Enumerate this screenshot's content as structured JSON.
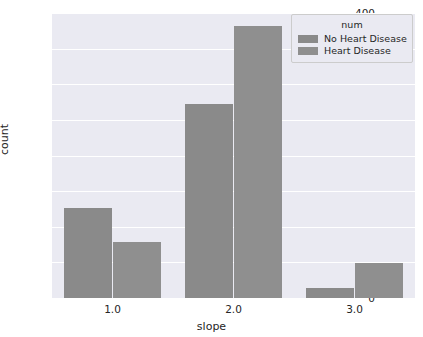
{
  "chart_data": {
    "type": "bar",
    "title": "",
    "xlabel": "slope",
    "ylabel": "count",
    "categories": [
      "1.0",
      "2.0",
      "3.0"
    ],
    "series": [
      {
        "name": "No Heart Disease",
        "values": [
          126,
          272,
          14
        ],
        "color": "#8a8a8a"
      },
      {
        "name": "Heart Disease",
        "values": [
          78,
          382,
          49
        ],
        "color": "#8f8f8f"
      }
    ],
    "ylim": [
      0,
      400
    ],
    "yticks": [
      0,
      50,
      100,
      150,
      200,
      250,
      300,
      350,
      400
    ],
    "ytick_labels": [
      "0",
      "50",
      "100",
      "150",
      "200",
      "250",
      "300",
      "350",
      "400"
    ],
    "grid": true,
    "grid_color": "#ffffff",
    "axes_facecolor": "#eaeaf2",
    "figure_facecolor": "#ffffff",
    "legend": {
      "title": "num",
      "position": "upper right",
      "entries": [
        "No Heart Disease",
        "Heart Disease"
      ]
    }
  }
}
